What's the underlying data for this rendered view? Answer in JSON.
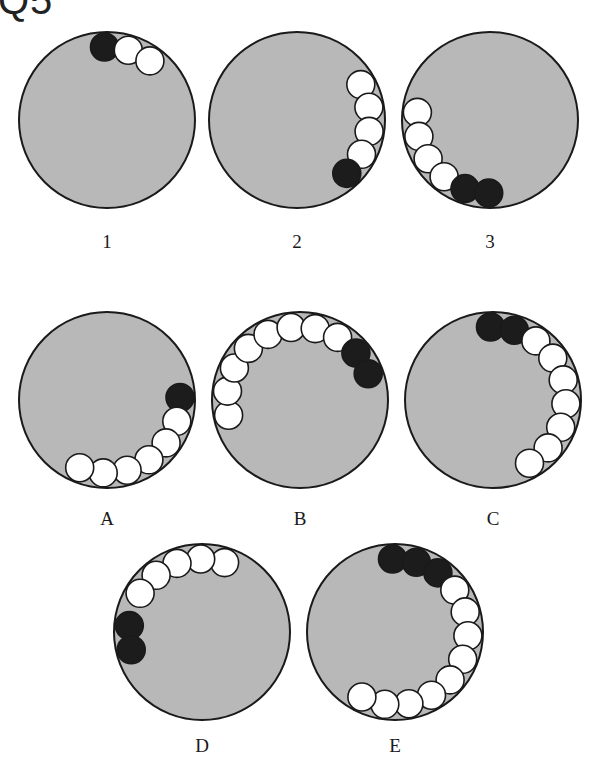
{
  "title": "Q5",
  "colors": {
    "disc_fill": "#b8b8b8",
    "disc_stroke": "#1a1a1a",
    "ball_white": "#ffffff",
    "ball_black": "#1c1c1c"
  },
  "ball_radius": 14,
  "disc_radius": 88,
  "panels": [
    {
      "label": "1",
      "cx": 107,
      "cy": 120,
      "label_y": 248,
      "balls": [
        {
          "color": "black",
          "angle": -92
        },
        {
          "color": "white",
          "angle": -73
        },
        {
          "color": "white",
          "angle": -54
        }
      ]
    },
    {
      "label": "2",
      "cx": 297,
      "cy": 120,
      "label_y": 248,
      "balls": [
        {
          "color": "white",
          "angle": -29
        },
        {
          "color": "white",
          "angle": -10
        },
        {
          "color": "white",
          "angle": 9
        },
        {
          "color": "white",
          "angle": 28
        },
        {
          "color": "black",
          "angle": 47
        }
      ]
    },
    {
      "label": "3",
      "cx": 490,
      "cy": 120,
      "label_y": 248,
      "balls": [
        {
          "color": "white",
          "angle": 186
        },
        {
          "color": "white",
          "angle": 167
        },
        {
          "color": "white",
          "angle": 148
        },
        {
          "color": "white",
          "angle": 129
        },
        {
          "color": "black",
          "angle": 110
        },
        {
          "color": "black",
          "angle": 91
        }
      ]
    },
    {
      "label": "A",
      "cx": 107,
      "cy": 400,
      "label_y": 525,
      "balls": [
        {
          "color": "black",
          "angle": -2
        },
        {
          "color": "white",
          "angle": 17
        },
        {
          "color": "white",
          "angle": 36
        },
        {
          "color": "white",
          "angle": 55
        },
        {
          "color": "white",
          "angle": 74
        },
        {
          "color": "white",
          "angle": 93
        },
        {
          "color": "white",
          "angle": 112
        }
      ]
    },
    {
      "label": "B",
      "cx": 300,
      "cy": 400,
      "label_y": 525,
      "balls": [
        {
          "color": "white",
          "angle": 168
        },
        {
          "color": "white",
          "angle": 187
        },
        {
          "color": "white",
          "angle": 206
        },
        {
          "color": "white",
          "angle": 225
        },
        {
          "color": "white",
          "angle": 244
        },
        {
          "color": "white",
          "angle": 263
        },
        {
          "color": "white",
          "angle": 282
        },
        {
          "color": "white",
          "angle": 301
        },
        {
          "color": "black",
          "angle": 320
        },
        {
          "color": "black",
          "angle": 339
        }
      ]
    },
    {
      "label": "C",
      "cx": 493,
      "cy": 400,
      "label_y": 525,
      "balls": [
        {
          "color": "black",
          "angle": -92
        },
        {
          "color": "black",
          "angle": -73
        },
        {
          "color": "white",
          "angle": -54
        },
        {
          "color": "white",
          "angle": -35
        },
        {
          "color": "white",
          "angle": -16
        },
        {
          "color": "white",
          "angle": 3
        },
        {
          "color": "white",
          "angle": 22
        },
        {
          "color": "white",
          "angle": 41
        },
        {
          "color": "white",
          "angle": 60
        }
      ]
    },
    {
      "label": "D",
      "cx": 202,
      "cy": 632,
      "label_y": 752,
      "balls": [
        {
          "color": "white",
          "angle": -72
        },
        {
          "color": "white",
          "angle": -91
        },
        {
          "color": "white",
          "angle": -110
        },
        {
          "color": "white",
          "angle": -129
        },
        {
          "color": "white",
          "angle": -148
        },
        {
          "color": "black",
          "angle": -175
        },
        {
          "color": "black",
          "angle": 166
        }
      ]
    },
    {
      "label": "E",
      "cx": 395,
      "cy": 632,
      "label_y": 752,
      "balls": [
        {
          "color": "black",
          "angle": -92
        },
        {
          "color": "black",
          "angle": -73
        },
        {
          "color": "black",
          "angle": -54
        },
        {
          "color": "white",
          "angle": -35
        },
        {
          "color": "white",
          "angle": -16
        },
        {
          "color": "white",
          "angle": 3
        },
        {
          "color": "white",
          "angle": 22
        },
        {
          "color": "white",
          "angle": 41
        },
        {
          "color": "white",
          "angle": 60
        },
        {
          "color": "white",
          "angle": 79
        },
        {
          "color": "white",
          "angle": 98
        },
        {
          "color": "white",
          "angle": 117
        }
      ]
    }
  ]
}
